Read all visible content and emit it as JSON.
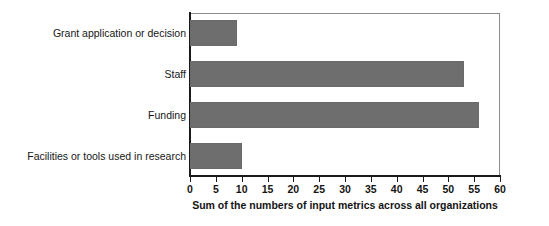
{
  "chart_data": {
    "type": "bar",
    "orientation": "horizontal",
    "title": "",
    "xlabel": "Sum of the numbers of input metrics across all organizations",
    "ylabel": "",
    "categories": [
      "Grant application or decision",
      "Staff",
      "Funding",
      "Facilities or tools used in research"
    ],
    "values": [
      9,
      53,
      56,
      10
    ],
    "xlim": [
      0,
      60
    ],
    "xticks": [
      0,
      5,
      10,
      15,
      20,
      25,
      30,
      35,
      40,
      45,
      50,
      55,
      60
    ],
    "xtick_labels": [
      "0",
      "5",
      "10",
      "15",
      "20",
      "25",
      "30",
      "35",
      "40",
      "45",
      "50",
      "55",
      "60"
    ],
    "grid": false,
    "legend": null,
    "bar_color": "#6e6e6e",
    "axis_color": "#1a1a1a",
    "plot_border_color": "#8c8c8c",
    "background_color": "#ffffff"
  }
}
